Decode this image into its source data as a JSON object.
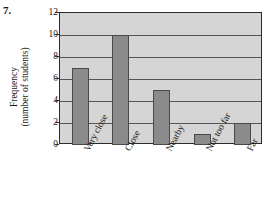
{
  "problem": {
    "number": "7."
  },
  "chart_data": {
    "type": "bar",
    "title": "",
    "xlabel": "",
    "ylabel": "Frequency (number of students)",
    "ylabel_lines": [
      "Frequency",
      "(number of students)"
    ],
    "categories": [
      "Very close",
      "Close",
      "Nearby",
      "Not too far",
      "Far"
    ],
    "values": [
      7,
      10,
      5,
      1,
      2
    ],
    "ylim": [
      0,
      12
    ],
    "yticks": [
      0,
      2,
      4,
      6,
      8,
      10,
      12
    ],
    "ytick_labels": [
      "0",
      "2",
      "4",
      "6",
      "8",
      "10",
      "12"
    ],
    "grid": true,
    "grid_axis": "y",
    "legend": false,
    "legend_position": "none",
    "colors": {
      "bar_fill": "#8b8b8b",
      "bar_edge": "#4a4a4a",
      "plot_background": "#d5d5d5",
      "axis": "#2b2b2b",
      "gridline": "#555555",
      "text": "#1a1a1a",
      "page_background": "#ffffff"
    }
  }
}
